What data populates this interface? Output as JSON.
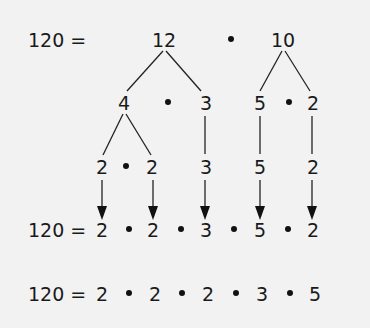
{
  "row1": {
    "label": "120 =",
    "left": "12",
    "right": "10"
  },
  "row2": {
    "a": "4",
    "b": "3",
    "c": "5",
    "d": "2"
  },
  "row3": {
    "a": "2",
    "b": "2",
    "c": "3",
    "d": "5",
    "e": "2"
  },
  "row4": {
    "label": "120 =",
    "factors": [
      "2",
      "2",
      "3",
      "5",
      "2"
    ]
  },
  "row5": {
    "label": "120 =",
    "factors": [
      "2",
      "2",
      "2",
      "3",
      "5"
    ]
  },
  "colors": {
    "background": "#f2f2f2",
    "ink": "#1a1a1a"
  }
}
